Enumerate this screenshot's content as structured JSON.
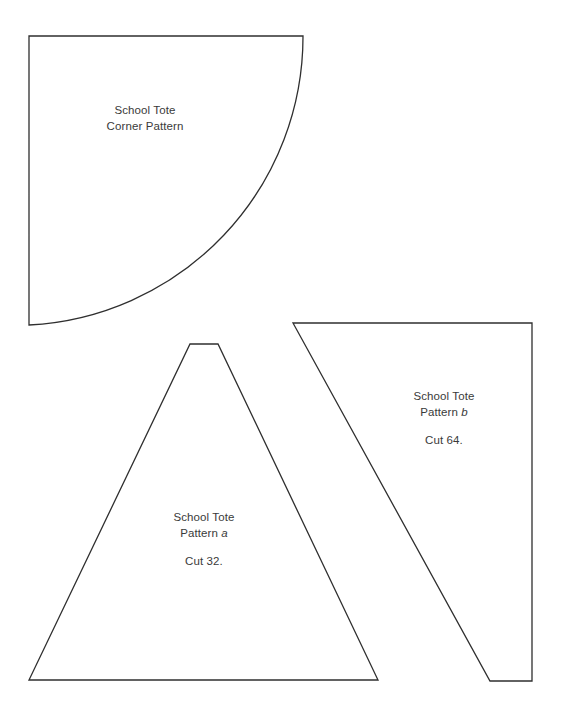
{
  "document": {
    "title": "School Tote Pattern Sheet",
    "background_color": "#ffffff",
    "line_color": "#2f2f2f",
    "text_color": "#3a3a3a"
  },
  "pieces": [
    {
      "id": "corner-pattern",
      "shape": "quarter-circle-corner",
      "label": {
        "line1": "School Tote",
        "line2_prefix": "Corner Pattern",
        "line2_letter": "",
        "cut_note": ""
      }
    },
    {
      "id": "pattern-a",
      "shape": "truncated-triangle",
      "label": {
        "line1": "School Tote",
        "line2_prefix": "Pattern ",
        "line2_letter": "a",
        "cut_note": "Cut 32."
      }
    },
    {
      "id": "pattern-b",
      "shape": "right-trapezoid",
      "label": {
        "line1": "School Tote",
        "line2_prefix": "Pattern ",
        "line2_letter": "b",
        "cut_note": "Cut 64."
      }
    }
  ]
}
